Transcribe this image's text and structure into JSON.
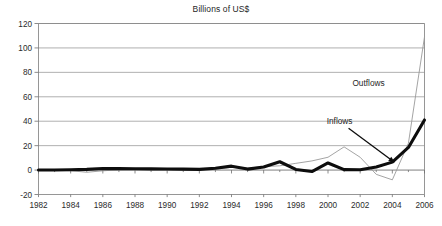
{
  "chart_data": {
    "type": "line",
    "title": "Billions of US$",
    "xlabel": "",
    "ylabel": "",
    "xlim": [
      1982,
      2006
    ],
    "ylim": [
      -20,
      120
    ],
    "ytick_values": [
      120,
      100,
      80,
      60,
      40,
      20,
      0,
      -20
    ],
    "ytick_labels": [
      "120",
      "100",
      "80",
      "60",
      "40",
      "20",
      "0",
      "-20"
    ],
    "xtick_values": [
      1982,
      1984,
      1986,
      1988,
      1990,
      1992,
      1994,
      1996,
      1998,
      2000,
      2002,
      2004,
      2006
    ],
    "xtick_labels": [
      "1982",
      "1984",
      "1986",
      "1988",
      "1990",
      "1992",
      "1994",
      "1996",
      "1998",
      "2000",
      "2002",
      "2004",
      "2006"
    ],
    "grid": true,
    "grid_axis": "y",
    "legend_position": "inline-annotations",
    "x": [
      1982,
      1983,
      1984,
      1985,
      1986,
      1987,
      1988,
      1989,
      1990,
      1991,
      1992,
      1993,
      1994,
      1995,
      1996,
      1997,
      1998,
      1999,
      2000,
      2001,
      2002,
      2003,
      2004,
      2005,
      2006
    ],
    "series": [
      {
        "name": "Inflows",
        "style": "thick-black",
        "color": "#0d0d0d",
        "values": [
          0,
          0,
          0.3,
          0.6,
          1.3,
          1.2,
          1.1,
          1,
          0.9,
          0.8,
          0.6,
          1.5,
          3.2,
          0.8,
          2.5,
          6.8,
          0.5,
          -1.2,
          5.8,
          0.4,
          0.3,
          2.5,
          6.5,
          18.5,
          41
        ]
      },
      {
        "name": "Outflows",
        "style": "thin-gray",
        "color": "#9a9a9a",
        "values": [
          0,
          0,
          -0.5,
          -1.8,
          -0.6,
          0.2,
          0.3,
          0.3,
          0.2,
          0.2,
          0.1,
          1.2,
          2.2,
          1.5,
          2.8,
          3.5,
          5.5,
          7.5,
          10.5,
          19,
          10.5,
          -3.5,
          -8,
          22,
          109
        ]
      }
    ],
    "annotations": [
      {
        "text": "Outflows",
        "target_series": "Outflows",
        "has_arrow": false,
        "x_fraction": 0.855,
        "y_value": 69
      },
      {
        "text": "Inflows",
        "target_series": "Inflows",
        "has_arrow": true,
        "x_fraction": 0.78,
        "y_value": 38
      }
    ],
    "colors": {
      "background": "#ffffff",
      "inflows": "#0d0d0d",
      "outflows": "#9a9a9a",
      "grid": "#8c8c8c",
      "axis": "#707070",
      "text": "#1f1f1f"
    }
  }
}
